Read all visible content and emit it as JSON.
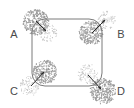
{
  "figure": {
    "background_color": "#ffffff",
    "width": 134,
    "height": 108,
    "shape": {
      "name": "rounded-rectangle",
      "x": 32,
      "y": 19,
      "width": 70,
      "height": 67,
      "corner_radius": 13,
      "stroke_color": "#7a7a7a",
      "stroke_width": 1,
      "fill": "none"
    },
    "stipple_colors": {
      "dense": "#9a9a9a",
      "sparse": "#c0c0c0"
    },
    "arrow_color": "#2b2b2b",
    "labels": [
      {
        "id": "A",
        "text": "A",
        "x": 14,
        "y": 35
      },
      {
        "id": "B",
        "text": "B",
        "x": 121,
        "y": 35
      },
      {
        "id": "C",
        "text": "C",
        "x": 14,
        "y": 92
      },
      {
        "id": "D",
        "text": "D",
        "x": 121,
        "y": 92
      }
    ],
    "corners": [
      {
        "id": "A",
        "corner": "top-left",
        "label": "A",
        "outer_blob": {
          "cx": 36,
          "cy": 22,
          "r": 13,
          "density": "dense"
        },
        "inner_blob": {
          "cx": 48,
          "cy": 33,
          "r": 9,
          "density": "sparse"
        },
        "arrow": {
          "x1": 36,
          "y1": 21,
          "x2": 46,
          "y2": 31,
          "direction": "inward-down-right"
        }
      },
      {
        "id": "B",
        "corner": "top-right",
        "label": "B",
        "outer_blob": {
          "cx": 107,
          "cy": 20,
          "r": 9,
          "density": "sparse"
        },
        "inner_blob": {
          "cx": 91,
          "cy": 33,
          "r": 12,
          "density": "dense"
        },
        "arrow": {
          "x1": 92,
          "y1": 33,
          "x2": 105,
          "y2": 20,
          "direction": "outward-up-right"
        }
      },
      {
        "id": "C",
        "corner": "bottom-left",
        "label": "C",
        "outer_blob": {
          "cx": 30,
          "cy": 86,
          "r": 10,
          "density": "sparse"
        },
        "inner_blob": {
          "cx": 45,
          "cy": 72,
          "r": 12,
          "density": "dense"
        },
        "arrow": {
          "x1": 31,
          "y1": 86,
          "x2": 44,
          "y2": 72,
          "direction": "inward-up-right"
        }
      },
      {
        "id": "D",
        "corner": "bottom-right",
        "label": "D",
        "outer_blob": {
          "cx": 103,
          "cy": 91,
          "r": 13,
          "density": "dense"
        },
        "inner_blob": {
          "cx": 88,
          "cy": 74,
          "r": 10,
          "density": "sparse"
        },
        "arrow": {
          "x1": 88,
          "y1": 75,
          "x2": 101,
          "y2": 89,
          "direction": "outward-down-right"
        }
      }
    ]
  }
}
